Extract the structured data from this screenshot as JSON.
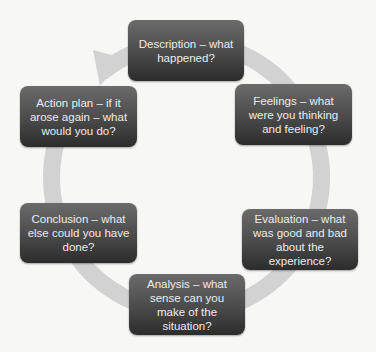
{
  "diagram": {
    "type": "cycle",
    "colors": {
      "background": "#f7f7f6",
      "ring": "#d0d0d0",
      "node_top": "#6b6b6b",
      "node_bottom": "#2c2c2c",
      "node_text": "#ececec"
    },
    "nodes": [
      {
        "id": "description",
        "label": "Description – what happened?"
      },
      {
        "id": "feelings",
        "label": "Feelings – what were you thinking and feeling?"
      },
      {
        "id": "evaluation",
        "label": "Evaluation – what was good and bad about the experience?"
      },
      {
        "id": "analysis",
        "label": "Analysis – what sense can you make of the situation?"
      },
      {
        "id": "conclusion",
        "label": "Conclusion – what else could you have done?"
      },
      {
        "id": "action_plan",
        "label": "Action plan – if it arose again – what would you do?"
      }
    ],
    "flow": "clockwise",
    "arrow_target": "description"
  }
}
